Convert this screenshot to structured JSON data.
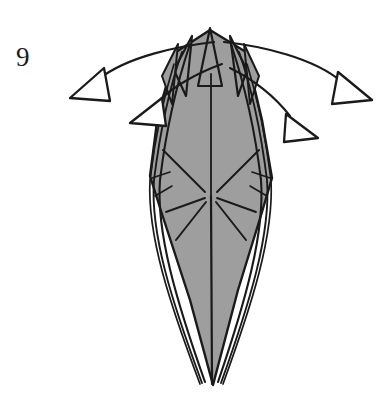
{
  "diagram": {
    "type": "origami-fold-step",
    "step_number": "9",
    "background_color": "#ffffff",
    "paper_fill_color": "#9e9e9e",
    "line_color": "#1a1a1a",
    "arrow_color": "#1a1a1a",
    "canvas": {
      "width": 391,
      "height": 400
    },
    "model": {
      "name": "layered-diamond-point",
      "description": "Elongated vertical diamond with multiple narrow layered flaps along each side, several sharp points at the top apex and a single sharp point at the bottom.",
      "apex_top": {
        "x": 210,
        "y": 28
      },
      "apex_bottom": {
        "x": 211,
        "y": 386
      },
      "widest_y": 183,
      "left_extent_x": 146,
      "right_extent_x": 272,
      "top_points_count": 5,
      "center_spine": true
    },
    "arrows": [
      {
        "name": "outer-left-fold-arrow",
        "direction": "left",
        "style": "hollow-triangle-head-curved-arc",
        "arc_from": {
          "x": 216,
          "y": 42
        },
        "arc_to": {
          "x": 100,
          "y": 80
        },
        "head_tip": {
          "x": 70,
          "y": 98
        }
      },
      {
        "name": "inner-left-fold-arrow",
        "direction": "left",
        "style": "hollow-triangle-head-curved-arc",
        "arc_from": {
          "x": 220,
          "y": 66
        },
        "arc_to": {
          "x": 158,
          "y": 105
        },
        "head_tip": {
          "x": 130,
          "y": 123
        }
      },
      {
        "name": "outer-right-fold-arrow",
        "direction": "right",
        "style": "hollow-triangle-head-curved-arc",
        "arc_from": {
          "x": 222,
          "y": 42
        },
        "arc_to": {
          "x": 340,
          "y": 80
        },
        "head_tip": {
          "x": 372,
          "y": 100
        }
      },
      {
        "name": "inner-right-fold-arrow",
        "direction": "right",
        "style": "hollow-triangle-head-curved-arc",
        "arc_from": {
          "x": 228,
          "y": 70
        },
        "arc_to": {
          "x": 288,
          "y": 118
        },
        "head_tip": {
          "x": 318,
          "y": 138
        }
      }
    ],
    "labels": {
      "step_label": "9"
    }
  }
}
